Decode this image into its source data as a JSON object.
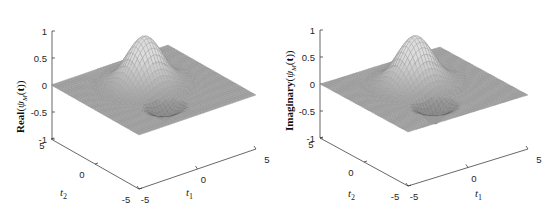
{
  "chart_data": [
    {
      "type": "surface3d",
      "title": "",
      "zlabel": "Real(ψ_M(t))",
      "zlabel_prefix": "Real",
      "xlabel": "t_1",
      "ylabel": "t_2",
      "xlim": [
        -5,
        5
      ],
      "ylim": [
        -5,
        5
      ],
      "zlim": [
        -1,
        1
      ],
      "x_ticks": [
        "-5",
        "0",
        "5"
      ],
      "y_ticks": [
        "5",
        "0",
        "-5"
      ],
      "z_ticks": [
        "1",
        "0.5",
        "0",
        "-0.5",
        "-1"
      ],
      "peak": {
        "t1": 0,
        "t2": 1,
        "value": 0.9
      },
      "trough": {
        "t1": -1,
        "t2": -2.5,
        "value": -0.25
      },
      "surface_color": "#9c9c9c",
      "grid": false
    },
    {
      "type": "surface3d",
      "title": "",
      "zlabel": "Imaginary(ψ_M(t))",
      "zlabel_prefix": "Imaginary",
      "xlabel": "t_1",
      "ylabel": "t_2",
      "xlim": [
        -5,
        5
      ],
      "ylim": [
        -5,
        5
      ],
      "zlim": [
        -1,
        1
      ],
      "x_ticks": [
        "-5",
        "0",
        "5"
      ],
      "y_ticks": [
        "5",
        "0",
        "-5"
      ],
      "z_ticks": [
        "1",
        "0.5",
        "0",
        "-0.5",
        "-1"
      ],
      "peak": {
        "t1": 0,
        "t2": 1,
        "value": 0.9
      },
      "trough": {
        "t1": -1,
        "t2": -2.5,
        "value": -0.35
      },
      "surface_color": "#9c9c9c",
      "grid": false
    }
  ],
  "panels": [
    {
      "zlabel_prefix": "Real",
      "zlabel_func": "ψ",
      "zlabel_sub": "M",
      "zlabel_arg": "t",
      "xlabel": "t",
      "xlabel_sub": "1",
      "ylabel": "t",
      "ylabel_sub": "2"
    },
    {
      "zlabel_prefix": "Imaginary",
      "zlabel_func": "ψ",
      "zlabel_sub": "M",
      "zlabel_arg": "t",
      "xlabel": "t",
      "xlabel_sub": "1",
      "ylabel": "t",
      "ylabel_sub": "2"
    }
  ]
}
